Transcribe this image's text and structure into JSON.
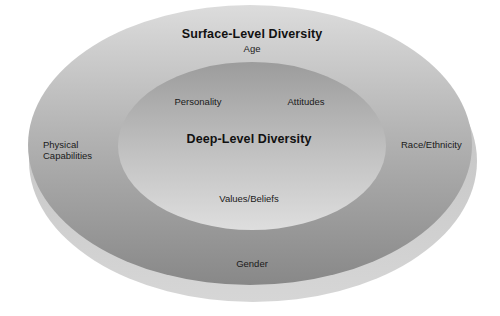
{
  "diagram": {
    "type": "concentric-ellipses",
    "outer_layer": {
      "title": "Surface-Level Diversity",
      "items": {
        "top": "Age",
        "left_line1": "Physical",
        "left_line2": "Capabilities",
        "right": "Race/Ethnicity",
        "bottom": "Gender"
      }
    },
    "inner_layer": {
      "title": "Deep-Level Diversity",
      "items": {
        "top_left": "Personality",
        "top_right": "Attitudes",
        "bottom": "Values/Beliefs"
      }
    },
    "colors": {
      "background": "#ffffff",
      "outer_surface_light": "#c9c9c9",
      "outer_surface_dark": "#8f8f8f",
      "outer_rim": "#c4c4c4",
      "inner_light": "#d8d8d8",
      "inner_dark": "#9a9a9a",
      "text": "#1a1a1a"
    }
  }
}
